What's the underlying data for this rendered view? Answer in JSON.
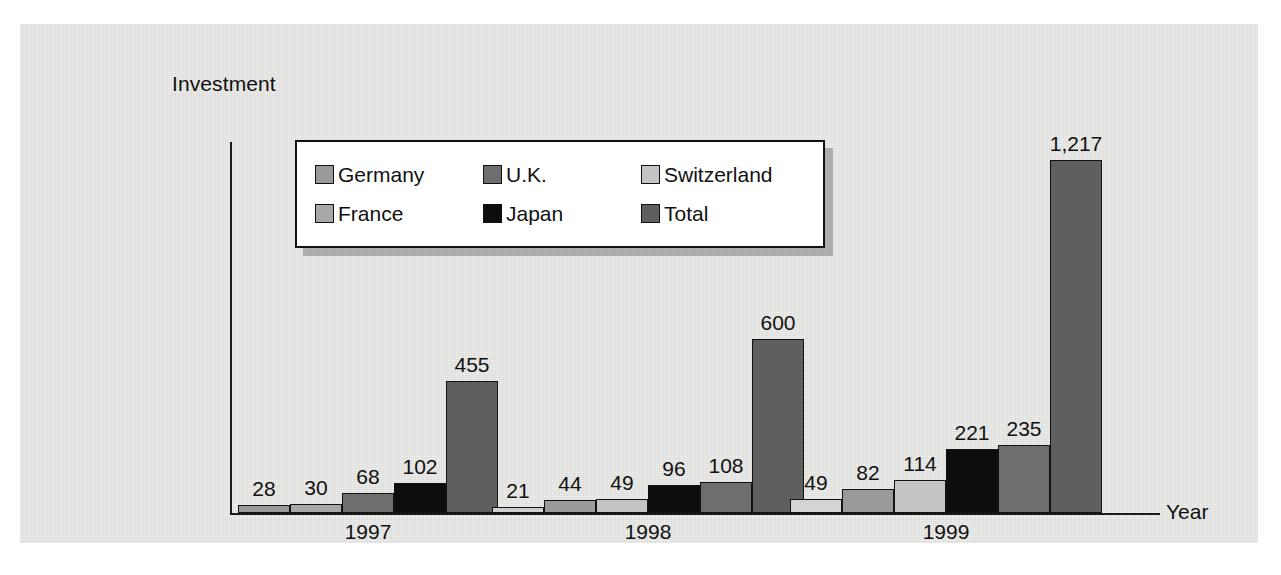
{
  "figure": {
    "background_color": "#e3e3e1",
    "axis_color": "#1a1a1a"
  },
  "legend": {
    "position": "top-center-inside",
    "items": [
      {
        "label": "Germany",
        "color": "#9a9a9a"
      },
      {
        "label": "U.K.",
        "color": "#6e6e6e"
      },
      {
        "label": "Switzerland",
        "color": "#c4c4c4"
      },
      {
        "label": "France",
        "color": "#a8a8a8"
      },
      {
        "label": "Japan",
        "color": "#0d0d0d"
      },
      {
        "label": "Total",
        "color": "#5f5f5f"
      }
    ]
  },
  "chart_data": {
    "type": "bar",
    "title": "",
    "ylabel": "Investment",
    "xlabel": "Year",
    "categories": [
      "1997",
      "1998",
      "1999"
    ],
    "grid": false,
    "ylim": [
      0,
      1300
    ],
    "series": [
      {
        "name": "Germany",
        "color": "#9a9a9a",
        "values": [
          28,
          21,
          49
        ]
      },
      {
        "name": "France",
        "color": "#a8a8a8",
        "values": [
          30,
          44,
          82
        ]
      },
      {
        "name": "Switzerland",
        "color": "#c4c4c4",
        "values": [
          null,
          49,
          114
        ]
      },
      {
        "name": "Japan",
        "color": "#0d0d0d",
        "values": [
          68,
          96,
          221
        ]
      },
      {
        "name": "U.K.",
        "color": "#6e6e6e",
        "values": [
          102,
          108,
          235
        ]
      },
      {
        "name": "Total",
        "color": "#5f5f5f",
        "values": [
          455,
          600,
          1217
        ]
      }
    ],
    "groups": [
      {
        "category": "1997",
        "bars": [
          {
            "series": "Germany",
            "value": 28,
            "label": "28",
            "color": "#9a9a9a"
          },
          {
            "series": "France",
            "value": 30,
            "label": "30",
            "color": "#a8a8a8"
          },
          {
            "series": "Japan",
            "value": 68,
            "label": "68",
            "color": "#6e6e6e"
          },
          {
            "series": "U.K.",
            "value": 102,
            "label": "102",
            "color": "#0d0d0d"
          },
          {
            "series": "Total",
            "value": 455,
            "label": "455",
            "color": "#5f5f5f"
          }
        ]
      },
      {
        "category": "1998",
        "bars": [
          {
            "series": "Germany",
            "value": 21,
            "label": "21",
            "color": "#cfcfcf"
          },
          {
            "series": "France",
            "value": 44,
            "label": "44",
            "color": "#9a9a9a"
          },
          {
            "series": "Switzerland",
            "value": 49,
            "label": "49",
            "color": "#c4c4c4"
          },
          {
            "series": "Japan",
            "value": 96,
            "label": "96",
            "color": "#0d0d0d"
          },
          {
            "series": "U.K.",
            "value": 108,
            "label": "108",
            "color": "#6e6e6e"
          },
          {
            "series": "Total",
            "value": 600,
            "label": "600",
            "color": "#5f5f5f"
          }
        ]
      },
      {
        "category": "1999",
        "bars": [
          {
            "series": "Germany",
            "value": 49,
            "label": "49",
            "color": "#d4d4d4"
          },
          {
            "series": "France",
            "value": 82,
            "label": "82",
            "color": "#9a9a9a"
          },
          {
            "series": "Switzerland",
            "value": 114,
            "label": "114",
            "color": "#c4c4c4"
          },
          {
            "series": "Japan",
            "value": 221,
            "label": "221",
            "color": "#0d0d0d"
          },
          {
            "series": "U.K.",
            "value": 235,
            "label": "235",
            "color": "#6e6e6e"
          },
          {
            "series": "Total",
            "value": 1217,
            "label": "1,217",
            "color": "#5f5f5f"
          }
        ]
      }
    ]
  }
}
